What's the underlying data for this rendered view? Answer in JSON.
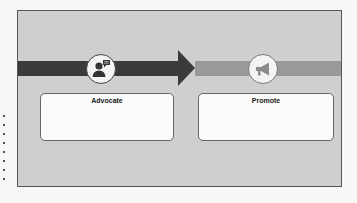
{
  "diagram": {
    "stages": [
      {
        "label": "Advocate",
        "icon": "person-speech-icon",
        "band_color": "#3a3a3a"
      },
      {
        "label": "Promote",
        "icon": "megaphone-icon",
        "band_color": "#999997"
      }
    ],
    "colors": {
      "frame_background": "#cfcfcd",
      "dark_band": "#3a3a3a",
      "light_band": "#999997",
      "card_background": "#fbfbfa"
    }
  }
}
